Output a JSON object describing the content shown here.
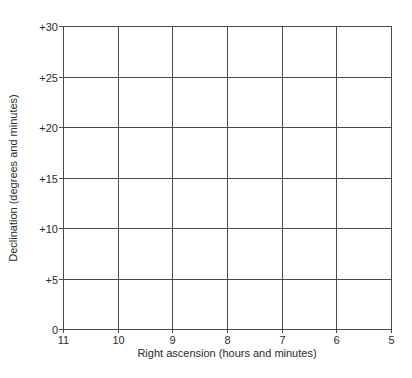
{
  "chart_data": {
    "type": "scatter",
    "title": "",
    "xlabel": "Right ascension (hours and minutes)",
    "ylabel": "Declination (degrees and minutes)",
    "x_ticks": [
      "11",
      "10",
      "9",
      "8",
      "7",
      "6",
      "5"
    ],
    "x_values": [
      11,
      10,
      9,
      8,
      7,
      6,
      5
    ],
    "y_ticks": [
      "0",
      "+5",
      "+10",
      "+15",
      "+20",
      "+25",
      "+30"
    ],
    "y_values": [
      0,
      5,
      10,
      15,
      20,
      25,
      30
    ],
    "xlim": [
      11,
      5
    ],
    "x_reversed": true,
    "ylim": [
      0,
      30
    ],
    "grid": true,
    "legend": null,
    "series": []
  },
  "colors": {
    "grid": "#4a4a4a",
    "text": "#2a2a2a",
    "background": "#ffffff"
  }
}
